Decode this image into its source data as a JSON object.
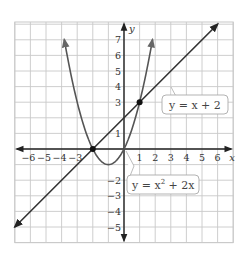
{
  "chart_data": {
    "type": "line",
    "title": "",
    "xlabel": "x",
    "ylabel": "y",
    "xlim": [
      -7,
      7
    ],
    "ylim": [
      -6,
      8
    ],
    "grid": true,
    "x_ticks": [
      "-6",
      "-5",
      "-4",
      "-3",
      "1",
      "2",
      "3",
      "4",
      "5",
      "6"
    ],
    "y_ticks": [
      "7",
      "6",
      "5",
      "4",
      "3",
      "1",
      "-2",
      "-3",
      "-4",
      "-5"
    ],
    "series": [
      {
        "name": "y = x + 2",
        "equation": "y = x + 2",
        "kind": "line",
        "x_range": [
          -7,
          6
        ],
        "color": "#333333"
      },
      {
        "name": "y = x^2 + 2x",
        "equation": "y = x^2 + 2x",
        "kind": "parabola",
        "vertex": [
          -1,
          -1
        ],
        "x_range": [
          -3.83,
          1.83
        ],
        "color": "#555555"
      }
    ],
    "points": [
      {
        "x": -2,
        "y": 0,
        "label": "intersection"
      },
      {
        "x": 1,
        "y": 3,
        "label": "intersection"
      }
    ],
    "annotations": [
      {
        "text": "y = x + 2",
        "points_to": "line"
      },
      {
        "text": "y = x² + 2x",
        "points_to": "parabola"
      }
    ]
  },
  "labels": {
    "line_prefix": "y = x + 2",
    "parabola_y": "y = x",
    "parabola_exp": "2",
    "parabola_rest": " + 2x",
    "x_axis": "x",
    "y_axis": "y"
  }
}
